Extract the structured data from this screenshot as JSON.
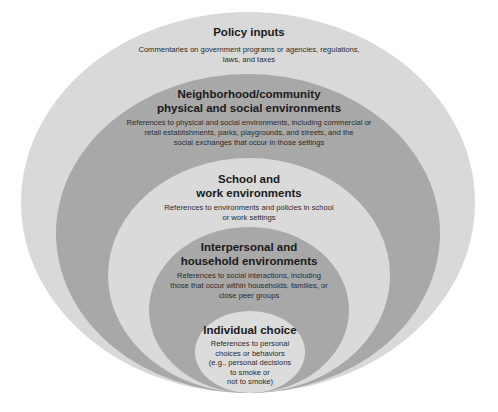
{
  "diagram": {
    "type": "nested-ellipses",
    "colors": {
      "light": "#d9d9d9",
      "dark": "#a6a6a6",
      "background": "#ffffff",
      "text": "#1a1a1a"
    },
    "levels": [
      {
        "title": "Policy inputs",
        "description": "Commentaries on government programs or agencies, regulations, laws, and taxes",
        "desc_lines": [
          "Commentaries on government programs or agencies, regulations,",
          "laws, and taxes"
        ],
        "fill": "light"
      },
      {
        "title": "Neighborhood/community physical and social environments",
        "title_lines": [
          "Neighborhood/community",
          "physical and social environments"
        ],
        "description": "References to physical and social environments, including commercial or retail establishments, parks, playgrounds, and streets, and the social exchanges that occur in those settings",
        "desc_lines": [
          "References to physical and social environments, including commercial or",
          "retail establishments, parks, playgrounds, and streets, and the",
          "social exchanges that occur in those settings"
        ],
        "fill": "dark"
      },
      {
        "title": "School and work environments",
        "title_lines": [
          "School and",
          "work environments"
        ],
        "description": "References to environments and policies in school or work settings",
        "desc_lines": [
          "References to environments and policies in school",
          "or work settings"
        ],
        "fill": "light"
      },
      {
        "title": "Interpersonal and household environments",
        "title_lines": [
          "Interpersonal and",
          "household environments"
        ],
        "description": "References to social interactions, including those that occur within households, families, or close peer groups",
        "desc_lines": [
          "References to social interactions, including",
          "those that occur within households, families, or",
          "close peer groups"
        ],
        "fill": "dark"
      },
      {
        "title": "Individual choice",
        "description": "References to personal choices or behaviors (e.g., personal decisions to smoke or not to smoke)",
        "desc_lines": [
          "References to personal",
          "choices or behaviors",
          "(e.g., personal decisions",
          "to smoke or",
          "not to smoke)"
        ],
        "fill": "light"
      }
    ]
  }
}
